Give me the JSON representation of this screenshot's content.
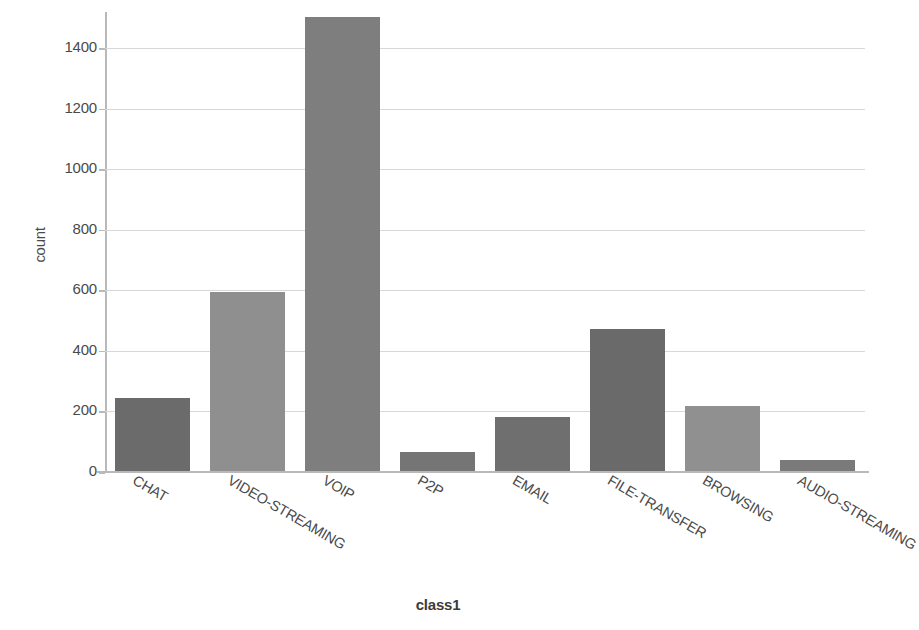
{
  "chart_data": {
    "type": "bar",
    "title": "",
    "xlabel": "class1",
    "ylabel": "count",
    "categories": [
      "CHAT",
      "VIDEO-STREAMING",
      "VOIP",
      "P2P",
      "EMAIL",
      "FILE-TRANSFER",
      "BROWSING",
      "AUDIO-STREAMING"
    ],
    "values": [
      240,
      592,
      1500,
      62,
      178,
      470,
      215,
      38
    ],
    "ylim": [
      0,
      1520
    ],
    "yticks": [
      0,
      200,
      400,
      600,
      800,
      1000,
      1200,
      1400
    ],
    "ytick_labels": [
      "0",
      "200",
      "400",
      "600",
      "800",
      "1000",
      "1200",
      "1400"
    ],
    "grid": true,
    "legend": "none",
    "bar_colors": [
      "#6b6b6b",
      "#8f8f8f",
      "#7e7e7e",
      "#757575",
      "#6f6f6f",
      "#6a6a6a",
      "#909090",
      "#7a7a7a"
    ],
    "grid_color": "#d8d8d8",
    "axis_color": "#b9b9b9",
    "background": "#ffffff",
    "xtick_rotation_deg": 30
  },
  "axes": {
    "y_title": "count",
    "x_title": "class1"
  }
}
